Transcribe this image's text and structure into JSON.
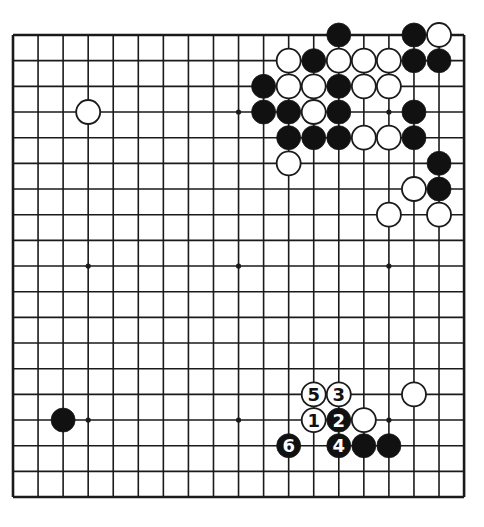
{
  "diagram": {
    "type": "go-board",
    "size": 19,
    "geometry": {
      "origin_x": 13,
      "origin_y": 35,
      "spacing_x": 25.06,
      "spacing_y": 25.67,
      "stone_radius": 12
    },
    "colors": {
      "background": "#ffffff",
      "line": "#1a1a1a",
      "black_stone": "#111111",
      "white_stone": "#ffffff",
      "label_on_black": "#ffffff",
      "label_on_white": "#111111"
    },
    "star_points": [
      [
        3,
        3
      ],
      [
        9,
        3
      ],
      [
        15,
        3
      ],
      [
        3,
        9
      ],
      [
        9,
        9
      ],
      [
        15,
        9
      ],
      [
        3,
        15
      ],
      [
        9,
        15
      ],
      [
        15,
        15
      ]
    ],
    "stones": [
      {
        "col": 13,
        "row": 0,
        "color": "black"
      },
      {
        "col": 16,
        "row": 0,
        "color": "black"
      },
      {
        "col": 17,
        "row": 0,
        "color": "white"
      },
      {
        "col": 11,
        "row": 1,
        "color": "white"
      },
      {
        "col": 12,
        "row": 1,
        "color": "black"
      },
      {
        "col": 13,
        "row": 1,
        "color": "white"
      },
      {
        "col": 14,
        "row": 1,
        "color": "white"
      },
      {
        "col": 15,
        "row": 1,
        "color": "white"
      },
      {
        "col": 16,
        "row": 1,
        "color": "black"
      },
      {
        "col": 17,
        "row": 1,
        "color": "black"
      },
      {
        "col": 10,
        "row": 2,
        "color": "black"
      },
      {
        "col": 11,
        "row": 2,
        "color": "white"
      },
      {
        "col": 12,
        "row": 2,
        "color": "white"
      },
      {
        "col": 13,
        "row": 2,
        "color": "black"
      },
      {
        "col": 14,
        "row": 2,
        "color": "white"
      },
      {
        "col": 15,
        "row": 2,
        "color": "white"
      },
      {
        "col": 3,
        "row": 3,
        "color": "white"
      },
      {
        "col": 10,
        "row": 3,
        "color": "black"
      },
      {
        "col": 11,
        "row": 3,
        "color": "black"
      },
      {
        "col": 12,
        "row": 3,
        "color": "white"
      },
      {
        "col": 13,
        "row": 3,
        "color": "black"
      },
      {
        "col": 16,
        "row": 3,
        "color": "black"
      },
      {
        "col": 11,
        "row": 4,
        "color": "black"
      },
      {
        "col": 12,
        "row": 4,
        "color": "black"
      },
      {
        "col": 13,
        "row": 4,
        "color": "black"
      },
      {
        "col": 14,
        "row": 4,
        "color": "white"
      },
      {
        "col": 15,
        "row": 4,
        "color": "white"
      },
      {
        "col": 16,
        "row": 4,
        "color": "black"
      },
      {
        "col": 11,
        "row": 5,
        "color": "white"
      },
      {
        "col": 17,
        "row": 5,
        "color": "black"
      },
      {
        "col": 16,
        "row": 6,
        "color": "white"
      },
      {
        "col": 17,
        "row": 6,
        "color": "black"
      },
      {
        "col": 15,
        "row": 7,
        "color": "white"
      },
      {
        "col": 17,
        "row": 7,
        "color": "white"
      },
      {
        "col": 12,
        "row": 14,
        "color": "white",
        "label": "5"
      },
      {
        "col": 13,
        "row": 14,
        "color": "white",
        "label": "3"
      },
      {
        "col": 16,
        "row": 14,
        "color": "white"
      },
      {
        "col": 2,
        "row": 15,
        "color": "black"
      },
      {
        "col": 12,
        "row": 15,
        "color": "white",
        "label": "1"
      },
      {
        "col": 13,
        "row": 15,
        "color": "black",
        "label": "2"
      },
      {
        "col": 14,
        "row": 15,
        "color": "white"
      },
      {
        "col": 11,
        "row": 16,
        "color": "black",
        "label": "6"
      },
      {
        "col": 13,
        "row": 16,
        "color": "black",
        "label": "4"
      },
      {
        "col": 14,
        "row": 16,
        "color": "black"
      },
      {
        "col": 15,
        "row": 16,
        "color": "black"
      }
    ],
    "move_sequence": [
      {
        "number": "1",
        "color": "white",
        "col": 12,
        "row": 15
      },
      {
        "number": "2",
        "color": "black",
        "col": 13,
        "row": 15
      },
      {
        "number": "3",
        "color": "white",
        "col": 13,
        "row": 14
      },
      {
        "number": "4",
        "color": "black",
        "col": 13,
        "row": 16
      },
      {
        "number": "5",
        "color": "white",
        "col": 12,
        "row": 14
      },
      {
        "number": "6",
        "color": "black",
        "col": 11,
        "row": 16
      }
    ]
  }
}
